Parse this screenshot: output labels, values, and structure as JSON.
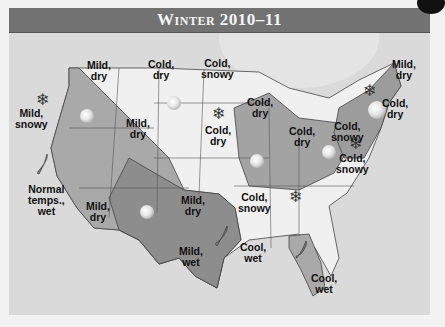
{
  "title": "Winter 2010–11",
  "colors": {
    "title_bar": "#727272",
    "background": "#dadada",
    "cold_region": "#f0f0f0",
    "mild_region": "#a9a9a9",
    "very_mild_region": "#8d8d8d",
    "border": "#444444"
  },
  "regions": [
    {
      "id": "pacific-northwest",
      "label": "Mild,\nsnowy",
      "icon": "snowflake-icon"
    },
    {
      "id": "northern-rockies",
      "label": "Mild,\ndry",
      "icon": "sun-icon"
    },
    {
      "id": "northern-plains",
      "label": "Cold,\ndry",
      "icon": ""
    },
    {
      "id": "upper-midwest",
      "label": "Cold,\nsnowy",
      "icon": "snowflake-icon"
    },
    {
      "id": "great-lakes",
      "label": "Cold,\ndry",
      "icon": ""
    },
    {
      "id": "central-rockies",
      "label": "Mild,\ndry",
      "icon": ""
    },
    {
      "id": "central-plains",
      "label": "Cold,\ndry",
      "icon": "sun-icon"
    },
    {
      "id": "ohio-valley",
      "label": "Cold,\ndry",
      "icon": "sun-icon"
    },
    {
      "id": "northeast-snowy",
      "label": "Cold,\nsnowy",
      "icon": "sun-icon"
    },
    {
      "id": "northern-new-england",
      "label": "Mild,\ndry",
      "icon": "sun-icon"
    },
    {
      "id": "southern-new-england",
      "label": "Cold,\ndry",
      "icon": ""
    },
    {
      "id": "mid-atlantic",
      "label": "Cold,\nsnowy",
      "icon": "snowflake-icon"
    },
    {
      "id": "california",
      "label": "Normal\ntemps.,\nwet",
      "icon": "raindrop-icon"
    },
    {
      "id": "desert-southwest",
      "label": "Mild,\ndry",
      "icon": "sun-icon"
    },
    {
      "id": "southern-plains",
      "label": "Mild,\ndry",
      "icon": ""
    },
    {
      "id": "texas",
      "label": "Mild,\nwet",
      "icon": "raindrop-icon"
    },
    {
      "id": "tennessee-valley",
      "label": "Cold,\nsnowy",
      "icon": "snowflake-icon"
    },
    {
      "id": "gulf-coast",
      "label": "Cool,\nwet",
      "icon": "raindrop-icon"
    },
    {
      "id": "florida",
      "label": "Cool,\nwet",
      "icon": ""
    }
  ]
}
